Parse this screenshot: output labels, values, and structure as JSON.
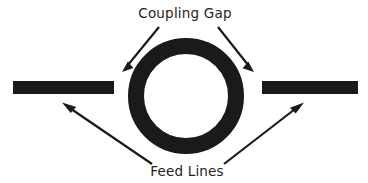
{
  "figure": {
    "width": 368,
    "height": 183,
    "background_color": "#ffffff",
    "ink_color": "#1a1a1a"
  },
  "labels": {
    "coupling_gap": "Coupling Gap",
    "feed_lines": "Feed Lines"
  },
  "annotations": {
    "coupling_gap_label": {
      "text": "Coupling Gap",
      "x": 185,
      "y": 18,
      "anchor": "middle"
    },
    "feed_lines_label": {
      "text": "Feed Lines",
      "x": 187,
      "y": 176,
      "anchor": "middle"
    }
  },
  "shapes": {
    "ring": {
      "name": "ring-resonator",
      "center_x": 186,
      "center_y": 96,
      "outer_radius": 58,
      "inner_radius": 42,
      "stroke_width": 16,
      "color": "#1a1a1a"
    },
    "feed_line_left": {
      "name": "feed-line-left",
      "x": 13,
      "y": 81,
      "width": 101,
      "height": 13,
      "color": "#1a1a1a"
    },
    "feed_line_right": {
      "name": "feed-line-right",
      "x": 262,
      "y": 81,
      "width": 96,
      "height": 13,
      "color": "#1a1a1a"
    }
  },
  "arrows": {
    "coupling_gap_left": {
      "name": "arrow-coupling-gap-left",
      "x1": 159,
      "y1": 27,
      "x2": 123,
      "y2": 71,
      "color": "#1a1a1a"
    },
    "coupling_gap_right": {
      "name": "arrow-coupling-gap-right",
      "x1": 218,
      "y1": 27,
      "x2": 253,
      "y2": 71,
      "color": "#1a1a1a"
    },
    "feed_lines_left": {
      "name": "arrow-feed-lines-left",
      "x1": 152,
      "y1": 164,
      "x2": 62,
      "y2": 103,
      "color": "#1a1a1a"
    },
    "feed_lines_right": {
      "name": "arrow-feed-lines-right",
      "x1": 224,
      "y1": 164,
      "x2": 304,
      "y2": 103,
      "color": "#1a1a1a"
    }
  }
}
